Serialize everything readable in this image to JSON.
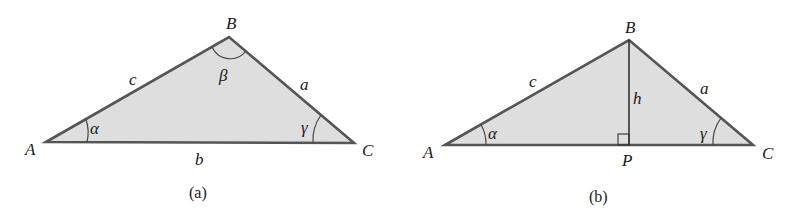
{
  "figure_a": {
    "caption": "(a)",
    "vertices": {
      "A": "A",
      "B": "B",
      "C": "C"
    },
    "sides": {
      "a": "a",
      "b": "b",
      "c": "c"
    },
    "angles": {
      "alpha": "α",
      "beta": "β",
      "gamma": "γ"
    }
  },
  "figure_b": {
    "caption": "(b)",
    "vertices": {
      "A": "A",
      "B": "B",
      "C": "C",
      "P": "P"
    },
    "sides": {
      "a": "a",
      "c": "c",
      "h": "h"
    },
    "angles": {
      "alpha": "α",
      "gamma": "γ"
    },
    "right_angle_marker": "right-angle-at-P"
  },
  "colors": {
    "fill": "#dedede",
    "stroke": "#555555",
    "text": "#1a1a1a"
  }
}
